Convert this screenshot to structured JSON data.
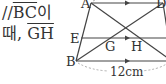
{
  "text": {
    "line1_prefix": "//",
    "line1_segment": "BC",
    "line1_suffix": "이",
    "line2_prefix": "때, ",
    "line2_segment": "GH"
  },
  "figure": {
    "labels": {
      "A": "A",
      "D": "D",
      "E": "E",
      "B": "B",
      "G": "G",
      "H": "H"
    },
    "measure": "12cm"
  }
}
